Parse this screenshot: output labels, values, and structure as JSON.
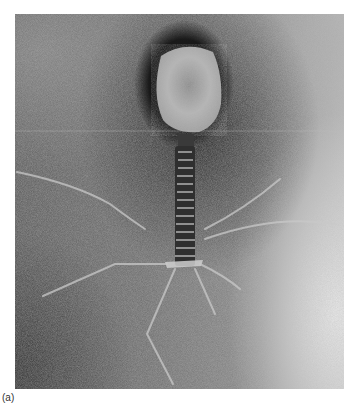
{
  "figure": {
    "label": "(a)",
    "colors": {
      "background_dark": "#3a3a3a",
      "background_mid": "#7a7a7a",
      "background_light": "#d0d0d0",
      "head": "#bdbdbd",
      "fibers": "#c8c8c8"
    }
  }
}
